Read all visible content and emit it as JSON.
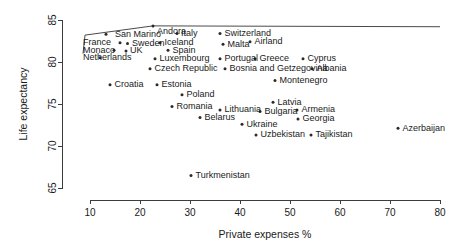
{
  "chart_data": {
    "type": "scatter",
    "title": "",
    "xlabel": "Private expenses %",
    "ylabel": "Life expectancy",
    "xlim": [
      8,
      80
    ],
    "ylim": [
      63.5,
      85.5
    ],
    "xticks": [
      "10",
      "20",
      "30",
      "40",
      "50",
      "60",
      "70",
      "80"
    ],
    "xtick_values": [
      10,
      20,
      30,
      40,
      50,
      60,
      70,
      80
    ],
    "yticks": [
      "65",
      "70",
      "75",
      "80",
      "85"
    ],
    "ytick_values": [
      65,
      70,
      75,
      80,
      85
    ],
    "grid": false,
    "legend": null,
    "marker_color": "#2b2b2b",
    "axis_color": "#3c3c3c",
    "points": [
      {
        "label": "San Marino",
        "x": 13.2,
        "y": 83.3,
        "lx": 15.0,
        "ly": 83.3,
        "anchor": "start"
      },
      {
        "label": "France",
        "x": 16.0,
        "y": 82.3,
        "lx": 8.6,
        "ly": 82.3,
        "anchor": "start"
      },
      {
        "label": "Sweden",
        "x": 17.5,
        "y": 82.2,
        "lx": 18.4,
        "ly": 82.2,
        "anchor": "start"
      },
      {
        "label": "Monaco",
        "x": 14.8,
        "y": 81.4,
        "lx": 8.6,
        "ly": 81.4,
        "anchor": "start"
      },
      {
        "label": "UK",
        "x": 17.2,
        "y": 81.3,
        "lx": 18.0,
        "ly": 81.3,
        "anchor": "start"
      },
      {
        "label": "Netherlands",
        "x": 12.0,
        "y": 80.5,
        "lx": 8.6,
        "ly": 80.5,
        "anchor": "start"
      },
      {
        "label": "Andora",
        "x": 22.6,
        "y": 84.3,
        "lx": 23.4,
        "ly": 83.6,
        "anchor": "start"
      },
      {
        "label": "Italy",
        "x": 27.4,
        "y": 83.4,
        "lx": 28.2,
        "ly": 83.4,
        "anchor": "start"
      },
      {
        "label": "Iceland",
        "x": 24.0,
        "y": 82.3,
        "lx": 24.9,
        "ly": 82.3,
        "anchor": "start"
      },
      {
        "label": "Spain",
        "x": 25.6,
        "y": 81.4,
        "lx": 26.5,
        "ly": 81.4,
        "anchor": "start"
      },
      {
        "label": "Luxembourg",
        "x": 23.0,
        "y": 80.4,
        "lx": 23.9,
        "ly": 80.4,
        "anchor": "start"
      },
      {
        "label": "Czech Republic",
        "x": 22.0,
        "y": 79.2,
        "lx": 22.9,
        "ly": 79.2,
        "anchor": "start"
      },
      {
        "label": "Switzerland",
        "x": 36.0,
        "y": 83.4,
        "lx": 36.9,
        "ly": 83.4,
        "anchor": "start"
      },
      {
        "label": "Malta",
        "x": 36.6,
        "y": 82.1,
        "lx": 37.5,
        "ly": 82.1,
        "anchor": "start"
      },
      {
        "label": "Airland",
        "x": 42.0,
        "y": 82.4,
        "lx": 42.9,
        "ly": 82.4,
        "anchor": "start"
      },
      {
        "label": "Portugal",
        "x": 36.0,
        "y": 80.4,
        "lx": 36.9,
        "ly": 80.4,
        "anchor": "start"
      },
      {
        "label": "Greece",
        "x": 43.0,
        "y": 80.4,
        "lx": 43.9,
        "ly": 80.4,
        "anchor": "start"
      },
      {
        "label": "Cyprus",
        "x": 52.6,
        "y": 80.4,
        "lx": 53.5,
        "ly": 80.4,
        "anchor": "start"
      },
      {
        "label": "Bosnia and Getzegovina",
        "x": 37.0,
        "y": 79.2,
        "lx": 37.9,
        "ly": 79.2,
        "anchor": "start"
      },
      {
        "label": "Albania",
        "x": 54.4,
        "y": 79.2,
        "lx": 55.3,
        "ly": 79.2,
        "anchor": "start"
      },
      {
        "label": "Montenegro",
        "x": 47.0,
        "y": 77.8,
        "lx": 47.9,
        "ly": 77.8,
        "anchor": "start"
      },
      {
        "label": "Croatia",
        "x": 14.0,
        "y": 77.3,
        "lx": 14.9,
        "ly": 77.3,
        "anchor": "start"
      },
      {
        "label": "Estonia",
        "x": 23.4,
        "y": 77.3,
        "lx": 24.3,
        "ly": 77.3,
        "anchor": "start"
      },
      {
        "label": "Poland",
        "x": 28.4,
        "y": 76.1,
        "lx": 29.3,
        "ly": 76.1,
        "anchor": "start"
      },
      {
        "label": "Latvia",
        "x": 46.6,
        "y": 75.2,
        "lx": 47.5,
        "ly": 75.2,
        "anchor": "start"
      },
      {
        "label": "Romania",
        "x": 26.4,
        "y": 74.7,
        "lx": 27.3,
        "ly": 74.7,
        "anchor": "start"
      },
      {
        "label": "Lithuania",
        "x": 36.0,
        "y": 74.3,
        "lx": 36.9,
        "ly": 74.3,
        "anchor": "start"
      },
      {
        "label": "Bulgaria",
        "x": 44.0,
        "y": 74.1,
        "lx": 44.9,
        "ly": 74.1,
        "anchor": "start"
      },
      {
        "label": "Armenia",
        "x": 51.4,
        "y": 74.3,
        "lx": 52.3,
        "ly": 74.3,
        "anchor": "start"
      },
      {
        "label": "Belarus",
        "x": 32.0,
        "y": 73.4,
        "lx": 32.9,
        "ly": 73.4,
        "anchor": "start"
      },
      {
        "label": "Ukraine",
        "x": 40.4,
        "y": 72.6,
        "lx": 41.3,
        "ly": 72.6,
        "anchor": "start"
      },
      {
        "label": "Georgia",
        "x": 51.6,
        "y": 73.2,
        "lx": 52.5,
        "ly": 73.2,
        "anchor": "start"
      },
      {
        "label": "Azerbaijan",
        "x": 71.6,
        "y": 72.1,
        "lx": 72.5,
        "ly": 72.1,
        "anchor": "start"
      },
      {
        "label": "Uzbekistan",
        "x": 43.2,
        "y": 71.3,
        "lx": 44.1,
        "ly": 71.3,
        "anchor": "start"
      },
      {
        "label": "Tajikistan",
        "x": 54.2,
        "y": 71.3,
        "lx": 55.1,
        "ly": 71.3,
        "anchor": "start"
      },
      {
        "label": "Turkmenistan",
        "x": 30.2,
        "y": 66.5,
        "lx": 31.1,
        "ly": 66.5,
        "anchor": "start"
      }
    ],
    "annotation_line": {
      "description": "line-artifact",
      "points": [
        [
          8.6,
          81.0
        ],
        [
          9.0,
          83.2
        ],
        [
          22.6,
          84.3
        ],
        [
          80.0,
          84.2
        ]
      ]
    }
  }
}
